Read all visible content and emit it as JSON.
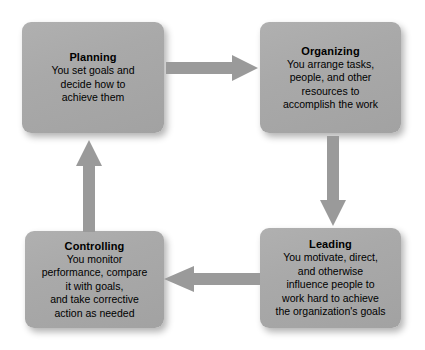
{
  "diagram": {
    "type": "cycle",
    "colors": {
      "box_fill": "#a9a9a9",
      "box_fill_light": "#b0b0b0",
      "box_fill_dark": "#a2a2a2",
      "arrow_fill": "#9a9a9a",
      "text": "#000000",
      "background": "#ffffff",
      "shadow": "rgba(0,0,0,0.30)"
    },
    "nodes": [
      {
        "id": "planning",
        "title": "Planning",
        "body": "You set goals and\ndecide how to\nachieve them"
      },
      {
        "id": "organizing",
        "title": "Organizing",
        "body": "You arrange tasks,\npeople, and other\nresources to\naccomplish the work"
      },
      {
        "id": "leading",
        "title": "Leading",
        "body": "You motivate, direct,\nand otherwise\ninfluence people to\nwork hard to achieve\nthe organization's goals"
      },
      {
        "id": "controlling",
        "title": "Controlling",
        "body": "You monitor\nperformance, compare\nit with goals,\nand take corrective\naction as needed"
      }
    ],
    "arrows": [
      {
        "id": "planning-to-organizing",
        "direction": "right",
        "from": "Planning",
        "to": "Organizing"
      },
      {
        "id": "organizing-to-leading",
        "direction": "down",
        "from": "Organizing",
        "to": "Leading"
      },
      {
        "id": "leading-to-controlling",
        "direction": "left",
        "from": "Leading",
        "to": "Controlling"
      },
      {
        "id": "controlling-to-planning",
        "direction": "up",
        "from": "Controlling",
        "to": "Planning"
      }
    ]
  }
}
